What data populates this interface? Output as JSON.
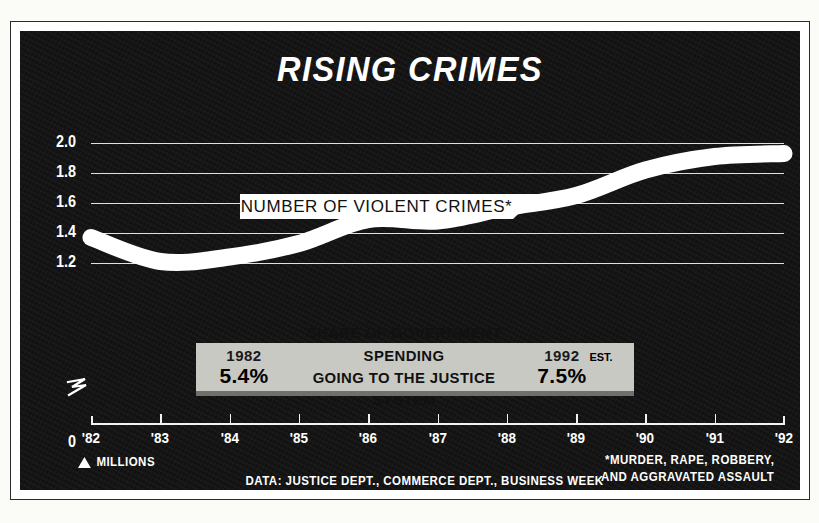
{
  "chart_data": {
    "type": "line",
    "title": "RISING CRIMES",
    "series_label": "NUMBER OF VIOLENT CRIMES*",
    "xlabel": "",
    "ylabel": "MILLIONS",
    "x": [
      "'82",
      "'83",
      "'84",
      "'85",
      "'86",
      "'87",
      "'88",
      "'89",
      "'90",
      "'91",
      "'92"
    ],
    "values": [
      1.37,
      1.21,
      1.24,
      1.33,
      1.49,
      1.48,
      1.57,
      1.65,
      1.82,
      1.91,
      1.93
    ],
    "ylim": [
      0,
      2.0
    ],
    "yticks": [
      "2.0",
      "1.8",
      "1.6",
      "1.4",
      "1.2",
      "0"
    ],
    "ytick_values": [
      2.0,
      1.8,
      1.6,
      1.4,
      1.2,
      0
    ],
    "axis_break": true,
    "grid": true,
    "legend_position": "inline-label",
    "units": "millions of violent crimes",
    "footnote": "*MURDER, RAPE, ROBBERY, AND AGGRAVATED ASSAULT",
    "source": "DATA: JUSTICE DEPT., COMMERCE DEPT., BUSINESS WEEK"
  },
  "callout": {
    "left_year": "1982",
    "left_value": "5.4%",
    "middle_line1": "SHARE OF GOVERNMENT SPENDING",
    "middle_line2": "GOING TO THE JUSTICE SYSTEM",
    "right_year": "1992",
    "right_value": "7.5%",
    "right_suffix": "EST."
  },
  "footer": {
    "units_label": "MILLIONS",
    "source": "DATA: JUSTICE DEPT., COMMERCE DEPT., BUSINESS WEEK",
    "note_line1": "*MURDER, RAPE, ROBBERY,",
    "note_line2": "AND AGGRAVATED ASSAULT"
  },
  "colors": {
    "panel_background": "#121212",
    "line": "#ffffff",
    "grid": "#f2f2ee",
    "callout_background": "#c9c9c4",
    "label_background": "#ffffff"
  }
}
